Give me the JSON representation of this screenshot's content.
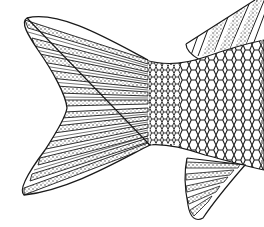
{
  "image": {
    "title": "Fish tail line drawing",
    "description": "Black-and-white stippled line-art illustration of a fish's caudal (tail) fin, scaled caudal peduncle, part of the dorsal fin (top right) and anal fin (bottom right)",
    "colors": {
      "background": "#ffffff",
      "ink": "#1a1a1a",
      "stipple": "#555555"
    },
    "parts": [
      {
        "name": "caudal-fin-upper-lobe"
      },
      {
        "name": "caudal-fin-lower-lobe"
      },
      {
        "name": "scaled-body"
      },
      {
        "name": "dorsal-fin"
      },
      {
        "name": "anal-fin"
      }
    ]
  }
}
